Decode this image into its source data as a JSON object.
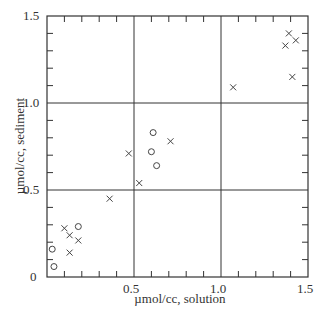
{
  "chart_data": {
    "type": "scatter",
    "title": "",
    "xlabel": "µmol/cc, solution",
    "ylabel": "µmol/cc, sediment",
    "xlim": [
      0,
      1.5
    ],
    "ylim": [
      0,
      1.5
    ],
    "xticks": [
      "0.5",
      "1.0",
      "1.5"
    ],
    "yticks": [
      "0",
      "0.5",
      "1.0",
      "1.5"
    ],
    "grid": "major lines at 0.5 and 1.0",
    "legend": "none",
    "series": [
      {
        "name": "circles",
        "marker": "o",
        "points": [
          [
            0.04,
            0.06
          ],
          [
            0.03,
            0.16
          ],
          [
            0.18,
            0.29
          ],
          [
            0.61,
            0.83
          ],
          [
            0.6,
            0.72
          ],
          [
            0.63,
            0.64
          ]
        ]
      },
      {
        "name": "crosses",
        "marker": "x",
        "points": [
          [
            0.1,
            0.28
          ],
          [
            0.13,
            0.24
          ],
          [
            0.13,
            0.14
          ],
          [
            0.18,
            0.21
          ],
          [
            0.36,
            0.45
          ],
          [
            0.47,
            0.71
          ],
          [
            0.53,
            0.54
          ],
          [
            0.71,
            0.78
          ],
          [
            1.07,
            1.09
          ],
          [
            1.39,
            1.4
          ],
          [
            1.37,
            1.33
          ],
          [
            1.43,
            1.36
          ],
          [
            1.41,
            1.15
          ]
        ]
      }
    ]
  },
  "axes": {
    "xlabel": "µmol/cc, solution",
    "ylabel": "µmol/cc, sediment",
    "y_ticks": [
      "0",
      "0.5",
      "1.0",
      "1.5"
    ],
    "x_ticks": [
      "0.5",
      "1.0",
      "1.5"
    ]
  }
}
